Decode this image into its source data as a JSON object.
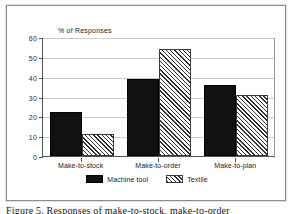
{
  "figure": {
    "caption": "Figure 5. Responses of make-to-stock, make-to-order"
  },
  "chart_data": {
    "type": "bar",
    "title": "",
    "subtitle": "",
    "xlabel": "",
    "ylabel": "% of Responses",
    "ylim": [
      0,
      60
    ],
    "yticks": [
      0,
      10,
      20,
      30,
      40,
      50,
      60
    ],
    "ytick_labels": [
      "0",
      "10",
      "20",
      "30",
      "40",
      "50",
      "60"
    ],
    "grid": true,
    "legend_position": "bottom-center",
    "categories": [
      "Make-to-stock",
      "Make-to-order",
      "Make-to-plan"
    ],
    "series": [
      {
        "name": "Machine tool",
        "fill": "solid-black",
        "color": "#111111",
        "values": [
          22,
          39,
          36
        ]
      },
      {
        "name": "Textile",
        "fill": "diagonal-hatch",
        "color": "#2f2f2f",
        "values": [
          11,
          54,
          31
        ]
      }
    ]
  }
}
